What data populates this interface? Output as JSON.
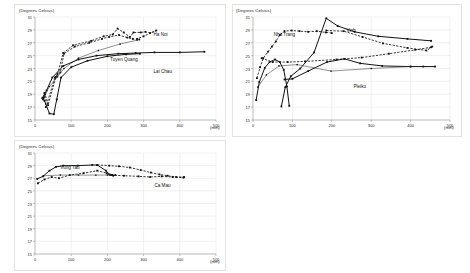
{
  "figure": {
    "background": "#ffffff",
    "accent": "#111111"
  },
  "panels": [
    {
      "id": "northern",
      "area_label": "Northern area",
      "y_axis_title": "(Degrees Celsius)",
      "x_axis_unit": "(mm)",
      "yticks": [
        "31",
        "29",
        "27",
        "25",
        "23",
        "21",
        "19",
        "17",
        "15"
      ],
      "xticks": [
        "0",
        "100",
        "200",
        "300",
        "400",
        "500"
      ],
      "series_labels": [
        {
          "text": "Ha Noi",
          "x": 0.655,
          "y": 0.145
        },
        {
          "text": "Tuyen Quang",
          "x": 0.415,
          "y": 0.385
        },
        {
          "text": "Lai Chau",
          "x": 0.655,
          "y": 0.505
        }
      ]
    },
    {
      "id": "central",
      "area_label": "Central area",
      "y_axis_title": "(Degrees Celsius)",
      "x_axis_unit": "(mm)",
      "yticks": [
        "31",
        "29",
        "27",
        "25",
        "23",
        "21",
        "19",
        "17",
        "15"
      ],
      "xticks": [
        "0",
        "100",
        "200",
        "300",
        "400",
        "500"
      ],
      "series_labels": [
        {
          "text": "Nha Trang",
          "x": 0.105,
          "y": 0.145
        },
        {
          "text": "Vinh",
          "x": 0.475,
          "y": 0.11
        },
        {
          "text": "Pleiku",
          "x": 0.51,
          "y": 0.655
        }
      ]
    },
    {
      "id": "southern",
      "area_label": "Southern area",
      "y_axis_title": "(Degrees Celsius)",
      "x_axis_unit": "(mm)",
      "yticks": [
        "31",
        "29",
        "27",
        "25",
        "23",
        "21",
        "19",
        "17",
        "15"
      ],
      "xticks": [
        "0",
        "100",
        "200",
        "300",
        "400",
        "500"
      ],
      "series_labels": [
        {
          "text": "Vung Tau",
          "x": 0.14,
          "y": 0.12
        },
        {
          "text": "Ca Mau",
          "x": 0.66,
          "y": 0.3
        }
      ]
    }
  ],
  "chart_data": [
    {
      "type": "scatter",
      "id": "northern",
      "title": "Northern area",
      "xlabel": "(mm)",
      "ylabel": "(Degrees Celsius)",
      "xlim": [
        0,
        500
      ],
      "ylim": [
        15,
        31
      ],
      "grid": true,
      "legend": "inline-annotations",
      "series": [
        {
          "name": "Ha Noi",
          "style": "dashed",
          "points": [
            [
              24,
              18.5
            ],
            [
              26,
              19.2
            ],
            [
              30,
              17.0
            ],
            [
              55,
              21.6
            ],
            [
              62,
              22.1
            ],
            [
              78,
              25.4
            ],
            [
              105,
              26.6
            ],
            [
              155,
              27.3
            ],
            [
              190,
              28.0
            ],
            [
              215,
              28.3
            ],
            [
              228,
              29.2
            ],
            [
              245,
              28.6
            ],
            [
              262,
              27.9
            ],
            [
              272,
              28.6
            ],
            [
              292,
              28.6
            ],
            [
              305,
              28.7
            ],
            [
              318,
              28.5
            ],
            [
              335,
              28.9
            ],
            [
              300,
              28.0
            ],
            [
              282,
              27.6
            ]
          ]
        },
        {
          "name": "Tuyen Quang",
          "style": "dashed",
          "points": [
            [
              22,
              18.2
            ],
            [
              28,
              19.0
            ],
            [
              36,
              17.3
            ],
            [
              58,
              21.7
            ],
            [
              70,
              22.4
            ],
            [
              80,
              25.3
            ],
            [
              110,
              26.4
            ],
            [
              150,
              27.0
            ],
            [
              185,
              27.6
            ],
            [
              205,
              27.9
            ],
            [
              232,
              28.2
            ],
            [
              255,
              27.8
            ],
            [
              270,
              27.6
            ],
            [
              288,
              27.5
            ]
          ]
        },
        {
          "name": "Tuyen Quang-mean",
          "style": "thin",
          "points": [
            [
              24,
              18.4
            ],
            [
              40,
              20.2
            ],
            [
              62,
              21.7
            ],
            [
              80,
              23.0
            ],
            [
              120,
              24.6
            ],
            [
              175,
              25.8
            ],
            [
              235,
              26.8
            ],
            [
              282,
              27.4
            ]
          ]
        },
        {
          "name": "Lai Chau",
          "style": "solid",
          "points": [
            [
              20,
              18.4
            ],
            [
              32,
              19.6
            ],
            [
              48,
              21.6
            ],
            [
              78,
              23.4
            ],
            [
              120,
              24.4
            ],
            [
              170,
              25.0
            ],
            [
              230,
              25.3
            ],
            [
              278,
              25.4
            ],
            [
              330,
              25.5
            ],
            [
              400,
              25.5
            ],
            [
              468,
              25.6
            ]
          ]
        },
        {
          "name": "Lai Chau-lower",
          "style": "solid",
          "points": [
            [
              26,
              18.0
            ],
            [
              40,
              16.0
            ],
            [
              52,
              15.9
            ],
            [
              60,
              18.2
            ],
            [
              72,
              21.6
            ],
            [
              100,
              23.2
            ],
            [
              145,
              24.2
            ],
            [
              200,
              24.9
            ],
            [
              252,
              25.2
            ],
            [
              290,
              25.3
            ]
          ]
        }
      ]
    },
    {
      "type": "scatter",
      "id": "central",
      "title": "Central area",
      "xlabel": "(mm)",
      "ylabel": "(Degrees Celsius)",
      "xlim": [
        0,
        500
      ],
      "ylim": [
        15,
        31
      ],
      "grid": true,
      "legend": "inline-annotations",
      "series": [
        {
          "name": "Nha Trang",
          "style": "dashed",
          "points": [
            [
              10,
              21.5
            ],
            [
              18,
              23.2
            ],
            [
              26,
              24.6
            ],
            [
              38,
              25.6
            ],
            [
              48,
              26.4
            ],
            [
              58,
              27.2
            ],
            [
              68,
              28.2
            ],
            [
              80,
              28.8
            ],
            [
              98,
              28.9
            ],
            [
              118,
              28.8
            ],
            [
              140,
              28.7
            ],
            [
              162,
              28.8
            ],
            [
              185,
              28.6
            ],
            [
              200,
              28.5
            ]
          ]
        },
        {
          "name": "Vinh",
          "style": "solid",
          "points": [
            [
              72,
              17.1
            ],
            [
              82,
              20.1
            ],
            [
              96,
              21.8
            ],
            [
              120,
              23.0
            ],
            [
              155,
              25.5
            ],
            [
              186,
              30.8
            ],
            [
              215,
              29.6
            ],
            [
              258,
              28.7
            ],
            [
              318,
              28.0
            ],
            [
              392,
              27.6
            ],
            [
              452,
              27.3
            ]
          ]
        },
        {
          "name": "Vinh-return",
          "style": "dashed",
          "points": [
            [
              186,
              28.9
            ],
            [
              230,
              28.8
            ],
            [
              278,
              27.9
            ],
            [
              330,
              26.9
            ],
            [
              392,
              26.2
            ],
            [
              440,
              25.8
            ],
            [
              455,
              26.4
            ]
          ]
        },
        {
          "name": "Central-mid",
          "style": "dashed",
          "points": [
            [
              22,
              24.6
            ],
            [
              50,
              24.0
            ],
            [
              88,
              24.0
            ],
            [
              132,
              24.1
            ],
            [
              212,
              24.4
            ],
            [
              276,
              24.7
            ],
            [
              345,
              25.3
            ],
            [
              412,
              25.9
            ],
            [
              452,
              26.3
            ]
          ]
        },
        {
          "name": "Pleiku",
          "style": "solid",
          "points": [
            [
              80,
              21.3
            ],
            [
              100,
              21.4
            ],
            [
              140,
              22.6
            ],
            [
              188,
              24.0
            ],
            [
              232,
              24.5
            ],
            [
              272,
              23.8
            ],
            [
              328,
              23.4
            ],
            [
              400,
              23.3
            ],
            [
              432,
              23.3
            ],
            [
              462,
              23.3
            ]
          ]
        },
        {
          "name": "Pleiku-thin",
          "style": "thin",
          "points": [
            [
              12,
              20.1
            ],
            [
              34,
              22.0
            ],
            [
              66,
              23.4
            ],
            [
              112,
              23.6
            ],
            [
              198,
              22.6
            ],
            [
              300,
              23.0
            ],
            [
              400,
              23.3
            ]
          ]
        },
        {
          "name": "Central-lower",
          "style": "solid",
          "points": [
            [
              8,
              18.1
            ],
            [
              16,
              20.9
            ],
            [
              30,
              23.1
            ],
            [
              42,
              24.0
            ],
            [
              56,
              24.4
            ],
            [
              68,
              24.0
            ],
            [
              78,
              22.8
            ],
            [
              86,
              20.2
            ],
            [
              92,
              17.2
            ]
          ]
        }
      ]
    },
    {
      "type": "scatter",
      "id": "southern",
      "title": "Southern area",
      "xlabel": "(mm)",
      "ylabel": "(Degrees Celsius)",
      "xlim": [
        0,
        500
      ],
      "ylim": [
        15,
        31
      ],
      "grid": true,
      "legend": "inline-annotations",
      "series": [
        {
          "name": "Vung Tau",
          "style": "solid",
          "points": [
            [
              6,
              26.9
            ],
            [
              22,
              27.3
            ],
            [
              40,
              28.2
            ],
            [
              58,
              28.8
            ],
            [
              78,
              29.0
            ],
            [
              118,
              29.0
            ],
            [
              158,
              29.1
            ],
            [
              172,
              29.1
            ],
            [
              196,
              28.2
            ],
            [
              206,
              27.6
            ],
            [
              214,
              27.5
            ]
          ]
        },
        {
          "name": "Vung Tau-dash",
          "style": "dashed",
          "points": [
            [
              8,
              26.2
            ],
            [
              26,
              26.8
            ],
            [
              46,
              27.2
            ],
            [
              66,
              27.0
            ],
            [
              96,
              27.5
            ],
            [
              134,
              27.8
            ],
            [
              172,
              28.2
            ],
            [
              198,
              27.8
            ],
            [
              208,
              27.5
            ],
            [
              216,
              27.4
            ],
            [
              222,
              27.5
            ]
          ]
        },
        {
          "name": "Ca Mau",
          "style": "dashed",
          "points": [
            [
              172,
              29.1
            ],
            [
              205,
              29.0
            ],
            [
              232,
              28.9
            ],
            [
              262,
              28.7
            ],
            [
              292,
              28.3
            ],
            [
              320,
              27.9
            ],
            [
              344,
              27.6
            ],
            [
              366,
              27.4
            ],
            [
              390,
              27.2
            ],
            [
              412,
              27.2
            ]
          ]
        },
        {
          "name": "Ca Mau-return",
          "style": "dashed",
          "points": [
            [
              210,
              27.5
            ],
            [
              246,
              27.4
            ],
            [
              286,
              27.3
            ],
            [
              318,
              27.2
            ],
            [
              350,
              27.3
            ],
            [
              380,
              27.2
            ],
            [
              410,
              27.1
            ]
          ]
        },
        {
          "name": "Southern-flat",
          "style": "thin",
          "points": [
            [
              24,
              27.4
            ],
            [
              70,
              27.5
            ],
            [
              120,
              27.5
            ],
            [
              168,
              27.5
            ],
            [
              200,
              27.5
            ],
            [
              214,
              27.5
            ]
          ]
        }
      ]
    }
  ]
}
